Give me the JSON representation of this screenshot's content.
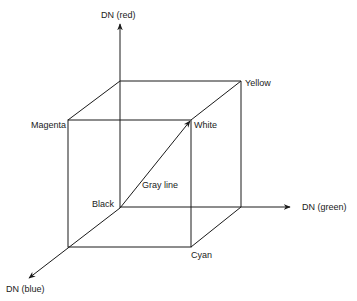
{
  "diagram": {
    "type": "rgb-color-cube",
    "axes": {
      "red": "DN (red)",
      "green": "DN (green)",
      "blue": "DN (blue)"
    },
    "vertices": {
      "black": "Black",
      "white": "White",
      "magenta": "Magenta",
      "yellow": "Yellow",
      "cyan": "Cyan"
    },
    "diagonal_label": "Gray line",
    "colors": {
      "line": "#1a1a1a",
      "background": "#ffffff"
    }
  }
}
